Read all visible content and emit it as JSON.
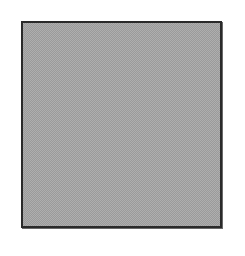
{
  "figure": {
    "shape": "square",
    "fill_pattern": "dithered-gray",
    "colors": {
      "background": "#ffffff",
      "fill": "#a8a8a8",
      "fill_dither": "#8e8e8e",
      "border": "#2a2a2a"
    }
  }
}
